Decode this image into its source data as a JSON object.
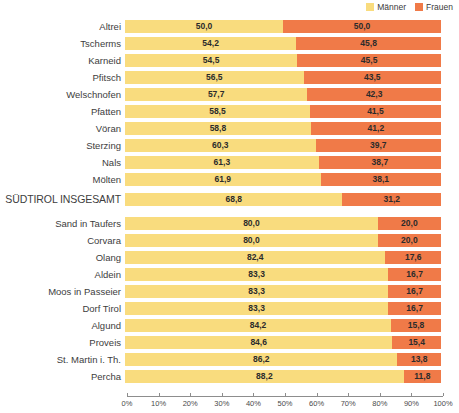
{
  "legend": {
    "position": "top-right",
    "items": [
      {
        "label": "Männer",
        "color": "#f9dc7e",
        "swatch_name": "legend-swatch-maenner"
      },
      {
        "label": "Frauen",
        "color": "#f07a48",
        "swatch_name": "legend-swatch-frauen"
      }
    ]
  },
  "axis": {
    "ticks": [
      "0%",
      "10%",
      "20%",
      "30%",
      "40%",
      "50%",
      "60%",
      "70%",
      "80%",
      "90%",
      "100%"
    ]
  },
  "chart_data": {
    "type": "bar",
    "orientation": "horizontal",
    "stacked": true,
    "normalized_percent": true,
    "title": "",
    "subtitle": "",
    "xlabel": "",
    "ylabel": "",
    "xlim": [
      0,
      100
    ],
    "xticks": [
      0,
      10,
      20,
      30,
      40,
      50,
      60,
      70,
      80,
      90,
      100
    ],
    "xtick_labels": [
      "0%",
      "10%",
      "20%",
      "30%",
      "40%",
      "50%",
      "60%",
      "70%",
      "80%",
      "90%",
      "100%"
    ],
    "grid": false,
    "legend_position": "top-right",
    "categories": [
      "Altrei",
      "Tscherms",
      "Karneid",
      "Pfitsch",
      "Welschnofen",
      "Pfatten",
      "Vöran",
      "Sterzing",
      "Nals",
      "Mölten",
      "SÜDTIROL INSGESAMT",
      "Sand in Taufers",
      "Corvara",
      "Olang",
      "Aldein",
      "Moos in Passeier",
      "Dorf Tirol",
      "Algund",
      "Proveis",
      "St. Martin i. Th.",
      "Percha"
    ],
    "series": [
      {
        "name": "Männer",
        "color": "#f9dc7e",
        "values": [
          50.0,
          54.2,
          54.5,
          56.5,
          57.7,
          58.5,
          58.8,
          60.3,
          61.3,
          61.9,
          68.8,
          80.0,
          80.0,
          82.4,
          83.3,
          83.3,
          83.3,
          84.2,
          84.6,
          86.2,
          88.2
        ],
        "labels": [
          "50,0",
          "54,2",
          "54,5",
          "56,5",
          "57,7",
          "58,5",
          "58,8",
          "60,3",
          "61,3",
          "61,9",
          "68,8",
          "80,0",
          "80,0",
          "82,4",
          "83,3",
          "83,3",
          "83,3",
          "84,2",
          "84,6",
          "86,2",
          "88,2"
        ]
      },
      {
        "name": "Frauen",
        "color": "#f07a48",
        "values": [
          50.0,
          45.8,
          45.5,
          43.5,
          42.3,
          41.5,
          41.2,
          39.7,
          38.7,
          38.1,
          31.2,
          20.0,
          20.0,
          17.6,
          16.7,
          16.7,
          16.7,
          15.8,
          15.4,
          13.8,
          11.8
        ],
        "labels": [
          "50,0",
          "45,8",
          "45,5",
          "43,5",
          "42,3",
          "41,5",
          "41,2",
          "39,7",
          "38,7",
          "38,1",
          "31,2",
          "20,0",
          "20,0",
          "17,6",
          "16,7",
          "16,7",
          "16,7",
          "15,8",
          "15,4",
          "13,8",
          "11,8"
        ]
      }
    ]
  }
}
